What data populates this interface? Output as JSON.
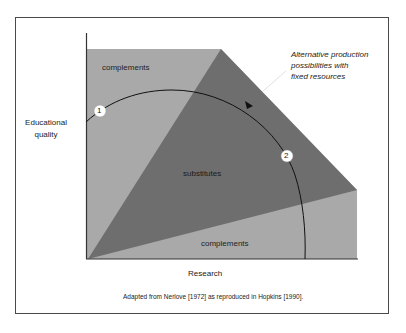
{
  "figure": {
    "y_axis_label_line1": "Educational",
    "y_axis_label_line2": "quality",
    "x_axis_label": "Research",
    "regions": {
      "top_left": "complements",
      "middle": "substitutes",
      "bottom": "complements"
    },
    "annotation": {
      "line1": "Alternative production",
      "line2": "possibilities with",
      "line3": "fixed resources"
    },
    "markers": [
      {
        "label": "1"
      },
      {
        "label": "2"
      }
    ],
    "caption": "Adapted from Nerlove [1972] as reproduced in Hopkins [1990].",
    "colors": {
      "complements_fill": "#a9a9a9",
      "substitutes_fill": "#6e6e6e",
      "axis": "#333333",
      "frame": "#4a4a4a"
    }
  }
}
